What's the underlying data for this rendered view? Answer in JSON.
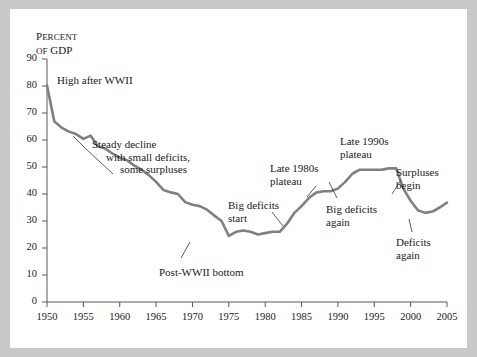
{
  "figure": {
    "panel_bg": "#ffffff",
    "border_color": "#c9c9c9",
    "line_color": "#808080",
    "text_color": "#1a1a1a"
  },
  "axis_title": {
    "line1_caps": "P",
    "line1_rest": "ERCENT",
    "line2_caps": "OF",
    "line2_rest": " GDP",
    "full": "Percent of GDP"
  },
  "chart_data": {
    "type": "line",
    "title": "Percent of GDP",
    "xlabel": "",
    "ylabel": "Percent of GDP",
    "xlim": [
      1950,
      2005
    ],
    "ylim": [
      0,
      90
    ],
    "grid": false,
    "legend": "none",
    "xticks": [
      1950,
      1955,
      1960,
      1965,
      1970,
      1975,
      1980,
      1985,
      1990,
      1995,
      2000,
      2005
    ],
    "yticks": [
      0,
      10,
      20,
      30,
      40,
      50,
      60,
      70,
      80,
      90
    ],
    "series": [
      {
        "name": "Debt as percent of GDP",
        "color": "#808080",
        "x": [
          1950,
          1951,
          1952,
          1953,
          1954,
          1955,
          1956,
          1957,
          1958,
          1959,
          1960,
          1961,
          1962,
          1963,
          1964,
          1965,
          1966,
          1967,
          1968,
          1969,
          1970,
          1971,
          1972,
          1973,
          1974,
          1975,
          1976,
          1977,
          1978,
          1979,
          1980,
          1981,
          1982,
          1983,
          1984,
          1985,
          1986,
          1987,
          1988,
          1989,
          1990,
          1991,
          1992,
          1993,
          1994,
          1995,
          1996,
          1997,
          1998,
          1999,
          2000,
          2001,
          2002,
          2003,
          2004,
          2005
        ],
        "y": [
          80.2,
          66.9,
          64.6,
          63.1,
          62.2,
          60.4,
          61.6,
          57.7,
          56.8,
          55.0,
          53.4,
          52.5,
          50.5,
          49.0,
          47.0,
          44.5,
          41.5,
          40.6,
          40.0,
          37.0,
          36.0,
          35.5,
          34.2,
          32.0,
          30.0,
          24.5,
          26.0,
          26.5,
          26.0,
          25.0,
          25.5,
          26.0,
          26.0,
          29.0,
          33.0,
          35.5,
          38.5,
          40.5,
          41.0,
          41.0,
          42.0,
          44.5,
          47.5,
          49.0,
          49.0,
          49.0,
          49.0,
          49.5,
          49.5,
          42.0,
          37.5,
          34.0,
          33.0,
          33.5,
          35.0,
          36.8
        ]
      }
    ],
    "annotations": [
      {
        "id": "high-after-wwii",
        "line1": "High after WWII",
        "line2": "",
        "line3": ""
      },
      {
        "id": "steady-decline",
        "line1": "Steady decline",
        "line2": "with small deficits,",
        "line3": "some surpluses"
      },
      {
        "id": "post-wwii-bottom",
        "line1": "Post-WWII bottom",
        "line2": "",
        "line3": ""
      },
      {
        "id": "big-deficits-start",
        "line1": "Big deficits",
        "line2": "start",
        "line3": ""
      },
      {
        "id": "late-1980s-plateau",
        "line1": "Late 1980s",
        "line2": "plateau",
        "line3": ""
      },
      {
        "id": "big-deficits-again",
        "line1": "Big deficits",
        "line2": "again",
        "line3": ""
      },
      {
        "id": "late-1990s-plateau",
        "line1": "Late 1990s",
        "line2": "plateau",
        "line3": ""
      },
      {
        "id": "surpluses-begin",
        "line1": "Surpluses",
        "line2": "begin",
        "line3": ""
      },
      {
        "id": "deficits-again",
        "line1": "Deficits",
        "line2": "again",
        "line3": ""
      }
    ]
  }
}
